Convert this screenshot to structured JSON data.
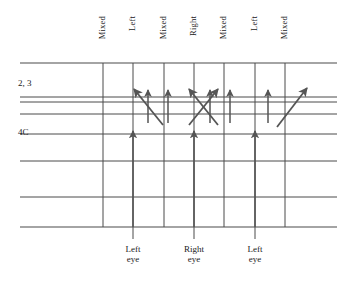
{
  "figure": {
    "width": 357,
    "height": 288,
    "background": "#ffffff",
    "line_color": "#4a4a4a",
    "arrow_color": "#555555",
    "text_color": "#1a1a1a"
  },
  "column_labels": [
    {
      "text": "Mixed",
      "x": 103
    },
    {
      "text": "Left",
      "x": 133
    },
    {
      "text": "Mixed",
      "x": 164
    },
    {
      "text": "Right",
      "x": 194
    },
    {
      "text": "Mixed",
      "x": 224
    },
    {
      "text": "Left",
      "x": 255
    },
    {
      "text": "Mixed",
      "x": 285
    }
  ],
  "layer_labels": [
    {
      "text": "2, 3",
      "x": 18,
      "y": 84
    },
    {
      "text": "4C",
      "x": 18,
      "y": 133
    }
  ],
  "eye_labels": [
    {
      "line1": "Left",
      "line2": "eye",
      "x": 133
    },
    {
      "line1": "Right",
      "line2": "eye",
      "x": 194
    },
    {
      "line1": "Left",
      "line2": "eye",
      "x": 255
    }
  ],
  "horizontal_lines": [
    {
      "y": 63,
      "x1": 20,
      "x2": 337,
      "weight": 1.1
    },
    {
      "y": 97,
      "x1": 20,
      "x2": 337,
      "weight": 1.0
    },
    {
      "y": 102,
      "x1": 20,
      "x2": 337,
      "weight": 1.0
    },
    {
      "y": 114,
      "x1": 20,
      "x2": 337,
      "weight": 1.0
    },
    {
      "y": 134,
      "x1": 20,
      "x2": 337,
      "weight": 1.0
    },
    {
      "y": 161,
      "x1": 20,
      "x2": 337,
      "weight": 1.0
    },
    {
      "y": 197,
      "x1": 20,
      "x2": 337,
      "weight": 1.0
    },
    {
      "y": 227,
      "x1": 20,
      "x2": 337,
      "weight": 1.1
    }
  ],
  "vertical_lines": [
    {
      "x": 103,
      "y1": 63,
      "y2": 227
    },
    {
      "x": 133,
      "y1": 63,
      "y2": 239
    },
    {
      "x": 164,
      "y1": 63,
      "y2": 227
    },
    {
      "x": 194,
      "y1": 63,
      "y2": 239
    },
    {
      "x": 224,
      "y1": 63,
      "y2": 227
    },
    {
      "x": 255,
      "y1": 63,
      "y2": 239
    },
    {
      "x": 285,
      "y1": 63,
      "y2": 227
    }
  ],
  "thalamic_arrows": [
    {
      "label": "Left eye input",
      "x1": 133,
      "y1": 227,
      "x2": 133,
      "y2": 131
    },
    {
      "label": "Right eye input",
      "x1": 194,
      "y1": 227,
      "x2": 194,
      "y2": 131
    },
    {
      "label": "Left eye input",
      "x1": 255,
      "y1": 227,
      "x2": 255,
      "y2": 131
    }
  ],
  "vertical_projections": [
    {
      "label": "Left to layer 2,3",
      "x1": 148,
      "y1": 123,
      "x2": 148,
      "y2": 90
    },
    {
      "label": "Left to layer 2,3",
      "x1": 168,
      "y1": 123,
      "x2": 168,
      "y2": 90
    },
    {
      "label": "Right to layer 2,3",
      "x1": 210,
      "y1": 123,
      "x2": 210,
      "y2": 90
    },
    {
      "label": "Right to layer 2,3",
      "x1": 230,
      "y1": 123,
      "x2": 230,
      "y2": 90
    },
    {
      "label": "Left to layer 2,3",
      "x1": 268,
      "y1": 123,
      "x2": 268,
      "y2": 90
    }
  ],
  "diagonal_projections": [
    {
      "label": "Left 4C to mixed 2,3 leftward",
      "x1": 163,
      "y1": 125,
      "x2": 134,
      "y2": 89
    },
    {
      "label": "Right 4C to mixed 2,3 leftward",
      "x1": 218,
      "y1": 125,
      "x2": 189,
      "y2": 89
    },
    {
      "label": "Right 4C to mixed 2,3 rightward",
      "x1": 189,
      "y1": 125,
      "x2": 218,
      "y2": 89
    },
    {
      "label": "Left 4C to mixed 2,3 rightward",
      "x1": 277,
      "y1": 127,
      "x2": 307,
      "y2": 88
    }
  ]
}
